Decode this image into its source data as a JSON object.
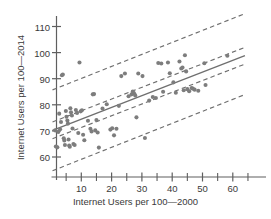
{
  "chart_data": {
    "type": "scatter",
    "title": "",
    "xlabel": "Internet Users per 100—2000",
    "ylabel": "Internet Users per 100—2014",
    "xlim": [
      0,
      66
    ],
    "ylim": [
      54,
      114
    ],
    "grid": false,
    "legend": false,
    "x_ticks_major": [
      10,
      20,
      30,
      40,
      50,
      60
    ],
    "x_ticks_minor": [
      5,
      15,
      25,
      35,
      45,
      55,
      65
    ],
    "y_ticks_major": [
      60,
      70,
      80,
      90,
      100,
      110
    ],
    "marker_color": "#7d7d7d",
    "line_color": "#6f6f6f",
    "band_color": "#6f6f6f",
    "fit_line": {
      "label": "least-squares regression line",
      "intercept": 70.0,
      "slope": 0.45,
      "x_start": 0.5,
      "x_end": 64.0
    },
    "confidence_band": {
      "label": "confidence interval band (inner dashed)",
      "lower": {
        "intercept": 66.8,
        "slope": 0.45
      },
      "upper": {
        "intercept": 73.2,
        "slope": 0.45
      },
      "x_start": 0.5,
      "x_end": 64.0
    },
    "prediction_band": {
      "label": "prediction interval band (outer dashed)",
      "lower": {
        "intercept": 54.5,
        "slope": 0.46
      },
      "upper": {
        "intercept": 85.5,
        "slope": 0.46
      },
      "x_start": 0.5,
      "x_end": 64.0
    },
    "points": [
      {
        "x": 1.4,
        "y": 70.2
      },
      {
        "x": 1.6,
        "y": 64.0
      },
      {
        "x": 2.1,
        "y": 63.7
      },
      {
        "x": 2.4,
        "y": 69.6
      },
      {
        "x": 2.7,
        "y": 76.6
      },
      {
        "x": 3.0,
        "y": 70.6
      },
      {
        "x": 3.3,
        "y": 73.4
      },
      {
        "x": 3.6,
        "y": 91.3
      },
      {
        "x": 3.9,
        "y": 91.6
      },
      {
        "x": 4.2,
        "y": 67.2
      },
      {
        "x": 4.4,
        "y": 66.3
      },
      {
        "x": 4.6,
        "y": 64.6
      },
      {
        "x": 4.9,
        "y": 77.6
      },
      {
        "x": 5.1,
        "y": 75.4
      },
      {
        "x": 5.4,
        "y": 74.0
      },
      {
        "x": 5.6,
        "y": 72.8
      },
      {
        "x": 5.8,
        "y": 66.7
      },
      {
        "x": 6.0,
        "y": 64.4
      },
      {
        "x": 6.2,
        "y": 63.9
      },
      {
        "x": 6.4,
        "y": 78.7
      },
      {
        "x": 6.6,
        "y": 77.1
      },
      {
        "x": 6.9,
        "y": 75.9
      },
      {
        "x": 7.1,
        "y": 70.9
      },
      {
        "x": 7.4,
        "y": 65.0
      },
      {
        "x": 7.8,
        "y": 64.6
      },
      {
        "x": 8.2,
        "y": 78.0
      },
      {
        "x": 8.6,
        "y": 76.9
      },
      {
        "x": 9.0,
        "y": 69.2
      },
      {
        "x": 9.4,
        "y": 96.2
      },
      {
        "x": 9.8,
        "y": 77.5
      },
      {
        "x": 10.2,
        "y": 77.9
      },
      {
        "x": 10.6,
        "y": 68.5
      },
      {
        "x": 11.0,
        "y": 66.4
      },
      {
        "x": 12.2,
        "y": 73.9
      },
      {
        "x": 13.0,
        "y": 70.8
      },
      {
        "x": 13.4,
        "y": 69.8
      },
      {
        "x": 13.8,
        "y": 84.0
      },
      {
        "x": 14.2,
        "y": 84.1
      },
      {
        "x": 14.6,
        "y": 70.2
      },
      {
        "x": 15.0,
        "y": 74.2
      },
      {
        "x": 15.4,
        "y": 69.4
      },
      {
        "x": 15.8,
        "y": 63.6
      },
      {
        "x": 17.0,
        "y": 78.6
      },
      {
        "x": 18.4,
        "y": 80.2
      },
      {
        "x": 19.6,
        "y": 70.5
      },
      {
        "x": 20.2,
        "y": 71.0
      },
      {
        "x": 20.8,
        "y": 68.3
      },
      {
        "x": 21.6,
        "y": 70.8
      },
      {
        "x": 22.4,
        "y": 79.6
      },
      {
        "x": 23.2,
        "y": 91.0
      },
      {
        "x": 24.4,
        "y": 92.0
      },
      {
        "x": 25.6,
        "y": 83.3
      },
      {
        "x": 26.6,
        "y": 84.0
      },
      {
        "x": 27.0,
        "y": 85.1
      },
      {
        "x": 27.4,
        "y": 84.4
      },
      {
        "x": 27.8,
        "y": 83.6
      },
      {
        "x": 28.2,
        "y": 75.2
      },
      {
        "x": 28.8,
        "y": 92.0
      },
      {
        "x": 30.2,
        "y": 91.0
      },
      {
        "x": 31.0,
        "y": 67.3
      },
      {
        "x": 32.4,
        "y": 81.6
      },
      {
        "x": 33.6,
        "y": 83.0
      },
      {
        "x": 34.6,
        "y": 82.6
      },
      {
        "x": 35.4,
        "y": 96.0
      },
      {
        "x": 36.4,
        "y": 95.8
      },
      {
        "x": 37.0,
        "y": 85.0
      },
      {
        "x": 38.6,
        "y": 96.2
      },
      {
        "x": 39.2,
        "y": 92.1
      },
      {
        "x": 40.4,
        "y": 88.6
      },
      {
        "x": 41.2,
        "y": 84.6
      },
      {
        "x": 42.4,
        "y": 96.6
      },
      {
        "x": 43.0,
        "y": 93.9
      },
      {
        "x": 43.4,
        "y": 94.3
      },
      {
        "x": 43.8,
        "y": 85.6
      },
      {
        "x": 44.2,
        "y": 99.0
      },
      {
        "x": 44.6,
        "y": 92.8
      },
      {
        "x": 45.0,
        "y": 86.0
      },
      {
        "x": 45.6,
        "y": 85.2
      },
      {
        "x": 46.4,
        "y": 86.4
      },
      {
        "x": 46.8,
        "y": 86.2
      },
      {
        "x": 47.4,
        "y": 85.8
      },
      {
        "x": 48.6,
        "y": 85.4
      },
      {
        "x": 50.6,
        "y": 95.9
      },
      {
        "x": 51.0,
        "y": 87.6
      },
      {
        "x": 58.2,
        "y": 98.8
      }
    ]
  }
}
